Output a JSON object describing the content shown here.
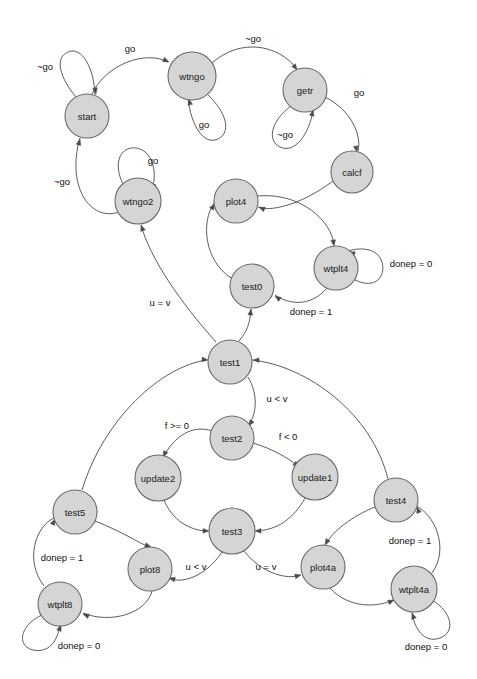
{
  "diagram": {
    "type": "state-machine-graph",
    "title": "",
    "canvas": {
      "width": 477,
      "height": 679,
      "background": "#ffffff"
    },
    "style": {
      "node_fill": "#d5d5d5",
      "node_stroke": "#6a6a6a",
      "edge_stroke": "#4a4a4a",
      "label_color": "#111111"
    },
    "nodes": [
      {
        "id": "start",
        "label": "start",
        "x": 87,
        "y": 116,
        "r": 22
      },
      {
        "id": "wtngo",
        "label": "wtngo",
        "x": 192,
        "y": 76,
        "r": 24
      },
      {
        "id": "getr",
        "label": "getr",
        "x": 305,
        "y": 90,
        "r": 22
      },
      {
        "id": "calcf",
        "label": "calcf",
        "x": 352,
        "y": 172,
        "r": 21
      },
      {
        "id": "wtngo2",
        "label": "wtngo2",
        "x": 138,
        "y": 201,
        "r": 23
      },
      {
        "id": "plot4",
        "label": "plot4",
        "x": 236,
        "y": 201,
        "r": 22
      },
      {
        "id": "wtplt4",
        "label": "wtplt4",
        "x": 336,
        "y": 268,
        "r": 22
      },
      {
        "id": "test0",
        "label": "test0",
        "x": 252,
        "y": 286,
        "r": 22
      },
      {
        "id": "test1",
        "label": "test1",
        "x": 230,
        "y": 362,
        "r": 22
      },
      {
        "id": "test2",
        "label": "test2",
        "x": 232,
        "y": 438,
        "r": 22
      },
      {
        "id": "update2",
        "label": "update2",
        "x": 158,
        "y": 478,
        "r": 23
      },
      {
        "id": "update1",
        "label": "update1",
        "x": 315,
        "y": 477,
        "r": 23
      },
      {
        "id": "test3",
        "label": "test3",
        "x": 232,
        "y": 531,
        "r": 23
      },
      {
        "id": "test5",
        "label": "test5",
        "x": 75,
        "y": 512,
        "r": 22
      },
      {
        "id": "plot8",
        "label": "plot8",
        "x": 150,
        "y": 569,
        "r": 22
      },
      {
        "id": "wtplt8",
        "label": "wtplt8",
        "x": 60,
        "y": 604,
        "r": 22
      },
      {
        "id": "test4",
        "label": "test4",
        "x": 396,
        "y": 500,
        "r": 22
      },
      {
        "id": "plot4a",
        "label": "plot4a",
        "x": 323,
        "y": 567,
        "r": 22
      },
      {
        "id": "wtplt4a",
        "label": "wtplt4a",
        "x": 414,
        "y": 589,
        "r": 23
      }
    ],
    "edges": [
      {
        "id": "e-start-self",
        "from": "start",
        "to": "start",
        "label": "~go",
        "label_x": 45,
        "label_y": 66
      },
      {
        "id": "e-start-wtngo",
        "from": "start",
        "to": "wtngo",
        "label": "go",
        "label_x": 130,
        "label_y": 48
      },
      {
        "id": "e-wtngo-self",
        "from": "wtngo",
        "to": "wtngo",
        "label": "go",
        "label_x": 204,
        "label_y": 124
      },
      {
        "id": "e-wtngo-getr",
        "from": "wtngo",
        "to": "getr",
        "label": "~go",
        "label_x": 253,
        "label_y": 38
      },
      {
        "id": "e-getr-self",
        "from": "getr",
        "to": "getr",
        "label": "~go",
        "label_x": 285,
        "label_y": 134
      },
      {
        "id": "e-getr-calcf",
        "from": "getr",
        "to": "calcf",
        "label": "go",
        "label_x": 359,
        "label_y": 92
      },
      {
        "id": "e-calcf-plot4",
        "from": "calcf",
        "to": "plot4",
        "label": "",
        "label_x": 0,
        "label_y": 0
      },
      {
        "id": "e-wtngo2-self",
        "from": "wtngo2",
        "to": "wtngo2",
        "label": "go",
        "label_x": 153,
        "label_y": 160
      },
      {
        "id": "e-wtngo2-start",
        "from": "wtngo2",
        "to": "start",
        "label": "~go",
        "label_x": 62,
        "label_y": 181
      },
      {
        "id": "e-plot4-wtplt4",
        "from": "plot4",
        "to": "wtplt4",
        "label": "",
        "label_x": 0,
        "label_y": 0
      },
      {
        "id": "e-wtplt4-self",
        "from": "wtplt4",
        "to": "wtplt4",
        "label": "donep = 0",
        "label_x": 411,
        "label_y": 263
      },
      {
        "id": "e-wtplt4-test0",
        "from": "wtplt4",
        "to": "test0",
        "label": "donep = 1",
        "label_x": 311,
        "label_y": 311
      },
      {
        "id": "e-test0-plot4",
        "from": "test0",
        "to": "plot4",
        "label": "",
        "label_x": 0,
        "label_y": 0
      },
      {
        "id": "e-test1-test0",
        "from": "test1",
        "to": "test0",
        "label": "",
        "label_x": 0,
        "label_y": 0
      },
      {
        "id": "e-test1-wtngo2",
        "from": "test1",
        "to": "wtngo2",
        "label": "u = v",
        "label_x": 160,
        "label_y": 302
      },
      {
        "id": "e-test1-test2",
        "from": "test1",
        "to": "test2",
        "label": "u < v",
        "label_x": 277,
        "label_y": 398
      },
      {
        "id": "e-test2-update2",
        "from": "test2",
        "to": "update2",
        "label": "f >= 0",
        "label_x": 177,
        "label_y": 425
      },
      {
        "id": "e-test2-update1",
        "from": "test2",
        "to": "update1",
        "label": "f < 0",
        "label_x": 288,
        "label_y": 436
      },
      {
        "id": "e-update2-test3",
        "from": "update2",
        "to": "test3",
        "label": "",
        "label_x": 0,
        "label_y": 0
      },
      {
        "id": "e-update1-test3",
        "from": "update1",
        "to": "test3",
        "label": "",
        "label_x": 0,
        "label_y": 0
      },
      {
        "id": "e-test3-plot8",
        "from": "test3",
        "to": "plot8",
        "label": "u < v",
        "label_x": 196,
        "label_y": 566
      },
      {
        "id": "e-test3-plot4a",
        "from": "test3",
        "to": "plot4a",
        "label": "u = v",
        "label_x": 266,
        "label_y": 566
      },
      {
        "id": "e-plot8-wtplt8",
        "from": "plot8",
        "to": "wtplt8",
        "label": "",
        "label_x": 0,
        "label_y": 0
      },
      {
        "id": "e-wtplt8-self",
        "from": "wtplt8",
        "to": "wtplt8",
        "label": "donep = 0",
        "label_x": 79,
        "label_y": 645
      },
      {
        "id": "e-wtplt8-test5",
        "from": "wtplt8",
        "to": "test5",
        "label": "donep = 1",
        "label_x": 62,
        "label_y": 557
      },
      {
        "id": "e-test5-plot8",
        "from": "test5",
        "to": "plot8",
        "label": "",
        "label_x": 0,
        "label_y": 0
      },
      {
        "id": "e-test5-test1",
        "from": "test5",
        "to": "test1",
        "label": "",
        "label_x": 0,
        "label_y": 0
      },
      {
        "id": "e-plot4a-wtplt4a",
        "from": "plot4a",
        "to": "wtplt4a",
        "label": "",
        "label_x": 0,
        "label_y": 0
      },
      {
        "id": "e-wtplt4a-self",
        "from": "wtplt4a",
        "to": "wtplt4a",
        "label": "donep = 0",
        "label_x": 426,
        "label_y": 646
      },
      {
        "id": "e-wtplt4a-test4",
        "from": "wtplt4a",
        "to": "test4",
        "label": "donep = 1",
        "label_x": 410,
        "label_y": 540
      },
      {
        "id": "e-test4-plot4a",
        "from": "test4",
        "to": "plot4a",
        "label": "",
        "label_x": 0,
        "label_y": 0
      },
      {
        "id": "e-test4-test1",
        "from": "test4",
        "to": "test1",
        "label": "",
        "label_x": 0,
        "label_y": 0
      }
    ],
    "paths": {
      "e-start-self": "M 76 97 C 60 78 54 58 68 52 C 82 46 94 68 95 95",
      "e-start-wtngo": "M 92 94 C 106 64 146 50 168 62",
      "e-wtngo-self": "M 208 95 C 226 112 232 132 218 139 C 203 146 191 124 188 99",
      "e-wtngo-getr": "M 212 63 C 240 38 278 44 297 69",
      "e-getr-self": "M 291 106 C 272 120 266 140 280 147 C 295 154 309 134 313 111",
      "e-getr-calcf": "M 325 97 C 351 110 362 135 358 151",
      "e-calcf-plot4": "M 333 181 C 300 206 268 212 258 207",
      "e-wtngo2-self": "M 124 186 C 112 164 120 146 136 148 C 152 150 158 172 152 189",
      "e-wtngo2-start": "M 119 212 C 90 222 66 186 80 138",
      "e-plot4-wtplt4": "M 257 196 C 302 192 332 222 334 245",
      "e-wtplt4-self": "M 355 280 C 376 290 386 276 382 262 C 378 248 360 247 349 251",
      "e-wtplt4-test0": "M 327 288 C 310 308 288 304 275 295",
      "e-test0-plot4": "M 231 278 C 204 260 201 222 214 203",
      "e-test1-test0": "M 239 341 C 250 328 250 318 251 309",
      "e-test1-wtngo2": "M 216 342 C 180 302 150 258 141 225",
      "e-test1-test2": "M 248 377 C 258 394 257 412 249 425",
      "e-test2-update2": "M 212 431 C 192 424 174 437 164 456",
      "e-test2-update1": "M 253 443 C 273 449 288 458 298 466",
      "e-update2-test3": "M 164 500 C 172 520 190 531 208 531",
      "e-update1-test3": "M 305 498 C 294 518 278 530 256 531",
      "e-test3-plot8": "M 222 552 C 205 578 180 584 169 578",
      "e-test3-plot4a": "M 244 551 C 262 574 288 580 300 575",
      "e-plot8-wtplt8": "M 152 591 C 146 614 110 624 83 613",
      "e-wtplt8-self": "M 42 615 C 20 625 16 646 33 650 C 52 654 58 636 60 626",
      "e-wtplt8-test5": "M 44 586 C 24 560 36 526 54 518",
      "e-test5-plot8": "M 95 521 C 128 534 146 548 150 546",
      "e-test5-test1": "M 82 490 C 104 418 162 366 207 360",
      "e-plot4a-wtplt4a": "M 330 588 C 348 608 376 608 393 600",
      "e-wtplt4a-self": "M 432 600 C 452 612 456 632 440 638 C 424 644 414 628 412 612",
      "e-wtplt4a-test4": "M 432 573 C 450 548 434 514 416 506",
      "e-test4-plot4a": "M 375 507 C 352 516 332 532 326 544",
      "e-test4-test1": "M 388 479 C 372 414 308 366 252 360"
    },
    "arrows": [
      {
        "id": "a-start-self",
        "x": 96,
        "y": 94,
        "angle": 80
      },
      {
        "id": "a-start-wtngo",
        "x": 169,
        "y": 62,
        "angle": 25
      },
      {
        "id": "a-wtngo-self",
        "x": 189,
        "y": 99,
        "angle": 258
      },
      {
        "id": "a-wtngo-getr",
        "x": 297,
        "y": 70,
        "angle": 55
      },
      {
        "id": "a-getr-self",
        "x": 313,
        "y": 110,
        "angle": 282
      },
      {
        "id": "a-getr-calcf",
        "x": 357,
        "y": 152,
        "angle": 78
      },
      {
        "id": "a-calcf-plot4",
        "x": 259,
        "y": 207,
        "angle": 205
      },
      {
        "id": "a-wtngo2-self",
        "x": 152,
        "y": 190,
        "angle": 105
      },
      {
        "id": "a-wtngo2-start",
        "x": 80,
        "y": 139,
        "angle": 285
      },
      {
        "id": "a-plot4-wtplt4",
        "x": 334,
        "y": 246,
        "angle": 82
      },
      {
        "id": "a-wtplt4-self",
        "x": 349,
        "y": 252,
        "angle": 200
      },
      {
        "id": "a-wtplt4-test0",
        "x": 275,
        "y": 296,
        "angle": 215
      },
      {
        "id": "a-test0-plot4",
        "x": 215,
        "y": 204,
        "angle": 305
      },
      {
        "id": "a-test1-test0",
        "x": 251,
        "y": 309,
        "angle": 277
      },
      {
        "id": "a-test1-wtngo2",
        "x": 141,
        "y": 225,
        "angle": 250
      },
      {
        "id": "a-test1-test2",
        "x": 249,
        "y": 426,
        "angle": 120
      },
      {
        "id": "a-test2-update2",
        "x": 163,
        "y": 457,
        "angle": 117
      },
      {
        "id": "a-test2-update1",
        "x": 299,
        "y": 467,
        "angle": 40
      },
      {
        "id": "a-update2-test3",
        "x": 209,
        "y": 531,
        "angle": 2
      },
      {
        "id": "a-update1-test3",
        "x": 255,
        "y": 531,
        "angle": 178
      },
      {
        "id": "a-test3-plot8",
        "x": 169,
        "y": 578,
        "angle": 195
      },
      {
        "id": "a-test3-plot4a",
        "x": 301,
        "y": 575,
        "angle": 346
      },
      {
        "id": "a-plot8-wtplt8",
        "x": 83,
        "y": 614,
        "angle": 202
      },
      {
        "id": "a-wtplt8-self",
        "x": 61,
        "y": 625,
        "angle": 290
      },
      {
        "id": "a-wtplt8-test5",
        "x": 55,
        "y": 519,
        "angle": 295
      },
      {
        "id": "a-test5-plot8",
        "x": 151,
        "y": 547,
        "angle": 20
      },
      {
        "id": "a-test5-test1",
        "x": 208,
        "y": 360,
        "angle": 5
      },
      {
        "id": "a-plot4a-wtplt4a",
        "x": 394,
        "y": 600,
        "angle": 335
      },
      {
        "id": "a-wtplt4a-self",
        "x": 412,
        "y": 613,
        "angle": 250
      },
      {
        "id": "a-wtplt4a-test4",
        "x": 417,
        "y": 507,
        "angle": 250
      },
      {
        "id": "a-test4-plot4a",
        "x": 325,
        "y": 545,
        "angle": 120
      },
      {
        "id": "a-test4-test1",
        "x": 253,
        "y": 360,
        "angle": 182
      }
    ]
  }
}
